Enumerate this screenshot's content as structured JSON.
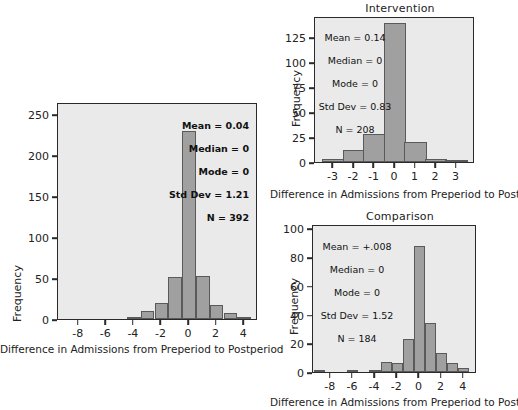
{
  "figure": {
    "background": "#ffffff",
    "bar_fill": "#a0a0a0",
    "bar_stroke": "#5a5a5a",
    "plot_background": "#eaeaea",
    "axis_color": "#2a2a2a"
  },
  "charts": [
    {
      "id": "total",
      "title": "",
      "xlabel": "Difference in Admissions from Preperiod to Postperiod",
      "ylabel": "Frequency",
      "yticks": [
        "0",
        "50",
        "100",
        "150",
        "200",
        "250"
      ],
      "ytick_values": [
        0,
        50,
        100,
        150,
        200,
        250
      ],
      "xticks": [
        "-8",
        "-6",
        "-4",
        "-2",
        "0",
        "2",
        "4"
      ],
      "xtick_values": [
        -8,
        -6,
        -4,
        -2,
        0,
        2,
        4
      ],
      "stats": {
        "mean": "Mean = 0.04",
        "median": "Median = 0",
        "mode": "Mode = 0",
        "std_dev": "Std Dev = 1.21",
        "n": "N = 392"
      }
    },
    {
      "id": "intervention",
      "title": "Intervention",
      "xlabel": "Difference in Admissions from Preperiod to Postperiod",
      "ylabel": "Frequency",
      "yticks": [
        "0",
        "25",
        "50",
        "75",
        "100",
        "125"
      ],
      "ytick_values": [
        0,
        25,
        50,
        75,
        100,
        125
      ],
      "xticks": [
        "-3",
        "-2",
        "-1",
        "0",
        "1",
        "2",
        "3"
      ],
      "xtick_values": [
        -3,
        -2,
        -1,
        0,
        1,
        2,
        3
      ],
      "stats": {
        "mean": "Mean = 0.14",
        "median": "Median = 0",
        "mode": "Mode = 0",
        "std_dev": "Std Dev = 0.83",
        "n": "N = 208"
      }
    },
    {
      "id": "comparison",
      "title": "Comparison",
      "xlabel": "Difference in Admissions from Preperiod to Postperiod",
      "ylabel": "Frequency",
      "yticks": [
        "0",
        "20",
        "40",
        "60",
        "80",
        "100"
      ],
      "ytick_values": [
        0,
        20,
        40,
        60,
        80,
        100
      ],
      "xticks": [
        "-8",
        "-6",
        "-4",
        "-2",
        "0",
        "2",
        "4"
      ],
      "xtick_values": [
        -8,
        -6,
        -4,
        -2,
        0,
        2,
        4
      ],
      "stats": {
        "mean": "Mean = +.008",
        "median": "Median = 0",
        "mode": "Mode = 0",
        "std_dev": "Std Dev = 1.52",
        "n": "N = 184"
      }
    }
  ],
  "chart_data": [
    {
      "type": "bar",
      "id": "total",
      "title": "",
      "xlabel": "Difference in Admissions from Preperiod to Postperiod",
      "ylabel": "Frequency",
      "categories": [
        -4,
        -3,
        -2,
        -1,
        0,
        1,
        2,
        3,
        4
      ],
      "values": [
        3,
        10,
        19,
        51,
        230,
        53,
        17,
        7,
        3
      ],
      "xlim": [
        -9.5,
        5.0
      ],
      "ylim": [
        0,
        265
      ],
      "grid": false,
      "legend": null,
      "annotations": [
        "Mean = 0.04",
        "Median = 0",
        "Mode = 0",
        "Std Dev = 1.21",
        "N = 392"
      ]
    },
    {
      "type": "bar",
      "id": "intervention",
      "title": "Intervention",
      "xlabel": "Difference in Admissions from Preperiod to Postperiod",
      "ylabel": "Frequency",
      "categories": [
        -3,
        -2,
        -1,
        0,
        1,
        2,
        3
      ],
      "values": [
        3,
        12,
        28,
        139,
        20,
        3,
        1
      ],
      "xlim": [
        -3.9,
        3.9
      ],
      "ylim": [
        0,
        146
      ],
      "grid": false,
      "legend": null,
      "annotations": [
        "Mean = 0.14",
        "Median = 0",
        "Mode = 0",
        "Std Dev = 0.83",
        "N = 208"
      ]
    },
    {
      "type": "bar",
      "id": "comparison",
      "title": "Comparison",
      "xlabel": "Difference in Admissions from Preperiod to Postperiod",
      "ylabel": "Frequency",
      "categories": [
        -9,
        -6,
        -4,
        -3,
        -2,
        -1,
        0,
        1,
        2,
        3,
        4
      ],
      "values": [
        1,
        1,
        1,
        7,
        6,
        23,
        88,
        34,
        13,
        6,
        3
      ],
      "xlim": [
        -9.6,
        5.2
      ],
      "ylim": [
        0,
        103
      ],
      "grid": false,
      "legend": null,
      "annotations": [
        "Mean = +.008",
        "Median = 0",
        "Mode = 0",
        "Std Dev = 1.52",
        "N = 184"
      ]
    }
  ]
}
